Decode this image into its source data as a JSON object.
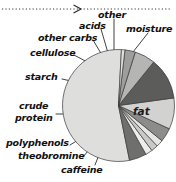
{
  "figure": {
    "top_rule": {
      "name": "dotted-arrow-rule",
      "arrow_x": 78
    },
    "inner_labels": [
      {
        "text": "fat",
        "x": 133,
        "y": 112
      }
    ],
    "callout_labels": [
      {
        "key": "other",
        "text": "other",
        "x": 98,
        "y": 15,
        "align": "left"
      },
      {
        "key": "acids",
        "text": "acids",
        "x": 80,
        "y": 25,
        "align": "left"
      },
      {
        "key": "moisture",
        "text": "moisture",
        "x": 128,
        "y": 29,
        "align": "left"
      },
      {
        "key": "other-carbs",
        "text": "other carbs",
        "x": 38,
        "y": 37,
        "align": "left"
      },
      {
        "key": "cellulose",
        "text": "cellulose",
        "x": 30,
        "y": 52,
        "align": "left"
      },
      {
        "key": "starch",
        "text": "starch",
        "x": 26,
        "y": 76,
        "align": "left"
      },
      {
        "key": "crude",
        "text": "crude",
        "x": 20,
        "y": 106,
        "align": "left"
      },
      {
        "key": "protein",
        "text": "protein",
        "x": 16,
        "y": 118,
        "align": "left"
      },
      {
        "key": "polyphenols",
        "text": "polyphenols",
        "x": 8,
        "y": 143,
        "align": "left"
      },
      {
        "key": "theobromine",
        "text": "theobromine",
        "x": 19,
        "y": 156,
        "align": "left"
      },
      {
        "key": "caffeine",
        "text": "caffeine",
        "x": 62,
        "y": 170,
        "align": "left"
      }
    ]
  },
  "chart_data": {
    "type": "pie",
    "title": "",
    "legend_position": "callout-labels",
    "center": {
      "x": 118,
      "y": 105
    },
    "radius": 56,
    "start_angle_deg": -87,
    "direction": "counterclockwise",
    "categories": [
      "fat",
      "moisture",
      "other",
      "acids",
      "other carbs",
      "cellulose",
      "starch",
      "crude protein",
      "polyphenols",
      "theobromine",
      "caffeine"
    ],
    "values": [
      54,
      5,
      2,
      2,
      2,
      4,
      9,
      12,
      6,
      3,
      1
    ],
    "colors": [
      "#dededd",
      "#6f6f6e",
      "#ededeb",
      "#c9c9c7",
      "#e6e6e4",
      "#8c8c8a",
      "#d2d2d0",
      "#5c5c5a",
      "#b5b5b3",
      "#9e9e9c",
      "#e0e0de"
    ],
    "edge_color": "#3a3a3a",
    "xlabel": "",
    "ylabel": ""
  }
}
